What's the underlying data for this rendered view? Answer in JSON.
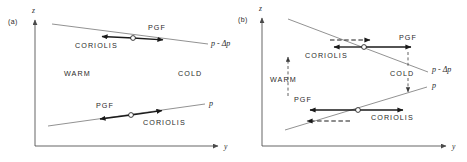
{
  "figure": {
    "panels": [
      {
        "id": "a",
        "panel_label": "(a)",
        "axes": {
          "x_label": "y",
          "y_label": "z"
        },
        "thermal_labels": [
          {
            "text": "WARM",
            "side": "left"
          },
          {
            "text": "COLD",
            "side": "right"
          }
        ],
        "isobars": [
          {
            "name": "upper-isobar",
            "label": "p - Δp",
            "slope": "down-to-right",
            "forces": [
              {
                "text": "CORIOLIS",
                "direction": "left"
              },
              {
                "text": "PGF",
                "direction": "right"
              }
            ]
          },
          {
            "name": "lower-isobar",
            "label": "p",
            "slope": "up-to-right",
            "forces": [
              {
                "text": "PGF",
                "direction": "left"
              },
              {
                "text": "CORIOLIS",
                "direction": "right"
              }
            ]
          }
        ]
      },
      {
        "id": "b",
        "panel_label": "(b)",
        "axes": {
          "x_label": "y",
          "y_label": "z"
        },
        "thermal_labels": [
          {
            "text": "WARM",
            "side": "left",
            "motion": "upward"
          },
          {
            "text": "COLD",
            "side": "right",
            "motion": "downward"
          }
        ],
        "isobars": [
          {
            "name": "upper-isobar",
            "label": "p - Δp",
            "slope": "down-to-right-steep",
            "forces": [
              {
                "text": "CORIOLIS",
                "direction": "left"
              },
              {
                "text": "PGF",
                "direction": "right"
              }
            ],
            "acceleration": {
              "direction": "right",
              "style": "dashed"
            }
          },
          {
            "name": "lower-isobar",
            "label": "p",
            "slope": "up-to-right",
            "forces": [
              {
                "text": "PGF",
                "direction": "left"
              },
              {
                "text": "CORIOLIS",
                "direction": "right"
              }
            ],
            "acceleration": {
              "direction": "left",
              "style": "dashed"
            }
          }
        ]
      }
    ],
    "colors": {
      "ink": "#1a1a1a",
      "axis": "#4a4a4a",
      "isobar": "#6e6e6e",
      "background": "#ffffff"
    }
  }
}
